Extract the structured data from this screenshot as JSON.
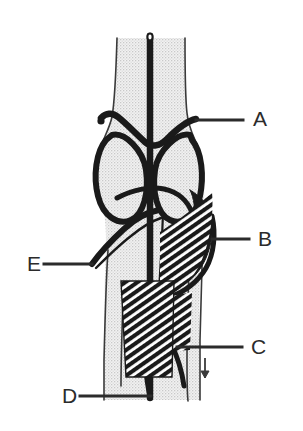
{
  "figure": {
    "background_color": "#ffffff",
    "ink_color": "#1a1a1a",
    "bone_fill_color": "#ebebeb",
    "stipple_dot_color": "#bdbdbd",
    "label_color": "#2b2b2b"
  },
  "labels": [
    {
      "id": "A",
      "text": "A",
      "x": 253,
      "y": 108,
      "leader": {
        "x1": 196,
        "y1": 120,
        "x2": 243,
        "y2": 120
      }
    },
    {
      "id": "B",
      "text": "B",
      "x": 258,
      "y": 228,
      "leader": {
        "x1": 212,
        "y1": 239,
        "x2": 249,
        "y2": 239
      }
    },
    {
      "id": "C",
      "text": "C",
      "x": 251,
      "y": 336,
      "leader": {
        "x1": 177,
        "y1": 347,
        "x2": 242,
        "y2": 347
      }
    },
    {
      "id": "D",
      "text": "D",
      "x": 62,
      "y": 385,
      "leader": {
        "x1": 80,
        "y1": 396,
        "x2": 151,
        "y2": 396
      }
    },
    {
      "id": "E",
      "text": "E",
      "x": 27,
      "y": 253,
      "leader": {
        "x1": 44,
        "y1": 264,
        "x2": 92,
        "y2": 264
      }
    }
  ],
  "structures": [
    {
      "name": "femoral-shaft",
      "kind": "bone-outline"
    },
    {
      "name": "medial-femoral-condyle",
      "kind": "bone-outline"
    },
    {
      "name": "lateral-femoral-condyle",
      "kind": "bone-outline"
    },
    {
      "name": "tibial-shaft",
      "kind": "bone-outline"
    },
    {
      "name": "midline-vessel",
      "kind": "vessel"
    },
    {
      "name": "vessel-terminal-loop",
      "kind": "vessel-detail"
    },
    {
      "name": "transverse-ligament-band",
      "kind": "ligament"
    },
    {
      "name": "oblique-popliteal-band",
      "kind": "ligament"
    },
    {
      "name": "medial-hatched-muscle",
      "kind": "muscle-hatched"
    },
    {
      "name": "lateral-hatched-muscle",
      "kind": "muscle-hatched"
    },
    {
      "name": "inferior-hatched-muscle",
      "kind": "muscle-hatched"
    },
    {
      "name": "vessel-branch-lateral",
      "kind": "vessel"
    },
    {
      "name": "vessel-branch-medial",
      "kind": "vessel"
    },
    {
      "name": "small-arrow-marker",
      "kind": "annotation-marker"
    }
  ]
}
